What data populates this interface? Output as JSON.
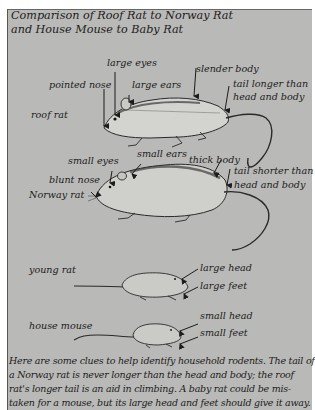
{
  "figure": {
    "title_line1": "Comparison of Roof Rat to Norway Rat",
    "title_line2": "and House Mouse to Baby Rat",
    "colors": {
      "panel": "#b9b9b7",
      "ink": "#1c1c1c",
      "page": "#ffffff"
    }
  },
  "roof_rat": {
    "name": "roof rat",
    "labels": {
      "large_eyes": "large eyes",
      "pointed_nose": "pointed nose",
      "large_ears": "large ears",
      "slender_body": "slender body",
      "tail_line1": "tail longer than",
      "tail_line2": "head and body"
    }
  },
  "norway_rat": {
    "name": "Norway rat",
    "labels": {
      "small_eyes": "small eyes",
      "small_ears": "small ears",
      "thick_body": "thick body",
      "blunt_nose": "blunt nose",
      "tail_line1": "tail shorter than",
      "tail_line2": "head and body"
    }
  },
  "young_rat": {
    "name": "young rat",
    "labels": {
      "head": "large head",
      "feet": "large feet"
    }
  },
  "house_mouse": {
    "name": "house mouse",
    "labels": {
      "head": "small head",
      "feet": "small feet"
    }
  },
  "caption": {
    "lines": [
      "Here are some clues to help identify household rodents. The tail of",
      "a Norway rat is never longer than the head and body; the roof",
      "rat's longer tail is an aid in climbing. A baby rat could be mis-",
      "taken for a mouse, but its large head and feet should give it away."
    ]
  }
}
